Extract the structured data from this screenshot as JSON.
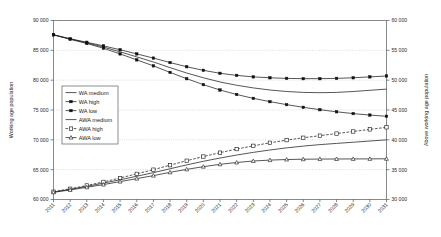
{
  "chart_data": {
    "type": "line",
    "title": "",
    "xlabel": "",
    "ylabel": "Working age population",
    "y2label": "Above working age population",
    "x": [
      2011,
      2012,
      2013,
      2014,
      2015,
      2016,
      2017,
      2018,
      2019,
      2020,
      2021,
      2022,
      2023,
      2024,
      2025,
      2026,
      2027,
      2028,
      2029,
      2030,
      2031
    ],
    "xtick_labels": [
      "2011",
      "2012",
      "2013",
      "2014",
      "2015",
      "2016",
      "2017",
      "2018",
      "2019",
      "2020",
      "2021",
      "2022",
      "2023",
      "2024",
      "2025",
      "2026",
      "2027",
      "2028",
      "2029",
      "2030",
      "2031"
    ],
    "ylim": [
      60000,
      90000
    ],
    "yticks": [
      60000,
      65000,
      70000,
      75000,
      80000,
      85000,
      90000
    ],
    "ytick_labels": [
      "60 000",
      "65 000",
      "70 000",
      "75 000",
      "80 000",
      "85 000",
      "90 000"
    ],
    "y2lim": [
      30000,
      60000
    ],
    "y2ticks": [
      30000,
      35000,
      40000,
      45000,
      50000,
      55000,
      60000
    ],
    "y2tick_labels": [
      "30 000",
      "35 000",
      "40 000",
      "45 000",
      "50 000",
      "55 000",
      "60 000"
    ],
    "grid": true,
    "legend_position": "left-middle",
    "series": [
      {
        "name": "WA medium",
        "axis": "left",
        "marker": "none",
        "line": "solid",
        "values": [
          87600,
          86900,
          86250,
          85550,
          84750,
          83900,
          83050,
          82100,
          81200,
          80400,
          79700,
          79150,
          78700,
          78350,
          78100,
          77950,
          77900,
          77950,
          78100,
          78300,
          78500
        ]
      },
      {
        "name": "WA high",
        "axis": "left",
        "marker": "filled-square",
        "line": "solid",
        "values": [
          87600,
          86950,
          86350,
          85750,
          85100,
          84400,
          83700,
          82950,
          82250,
          81650,
          81150,
          80800,
          80550,
          80400,
          80300,
          80250,
          80250,
          80300,
          80400,
          80550,
          80700
        ]
      },
      {
        "name": "WA low",
        "axis": "left",
        "marker": "filled-square",
        "line": "solid",
        "values": [
          87600,
          86850,
          86150,
          85350,
          84400,
          83400,
          82400,
          81300,
          80250,
          79250,
          78350,
          77600,
          76950,
          76400,
          75900,
          75450,
          75050,
          74700,
          74400,
          74150,
          73950
        ]
      },
      {
        "name": "AWA medium",
        "axis": "right",
        "marker": "none",
        "line": "solid",
        "values": [
          31250,
          31700,
          32200,
          32750,
          33300,
          33900,
          34500,
          35150,
          35800,
          36400,
          36950,
          37450,
          37900,
          38300,
          38650,
          38950,
          39200,
          39400,
          39600,
          39800,
          40000
        ]
      },
      {
        "name": "AWA high",
        "axis": "right",
        "marker": "open-square",
        "line": "dashed",
        "values": [
          31300,
          31800,
          32350,
          32950,
          33600,
          34300,
          35000,
          35750,
          36500,
          37200,
          37850,
          38450,
          39000,
          39500,
          39950,
          40350,
          40700,
          41050,
          41400,
          41750,
          42100
        ]
      },
      {
        "name": "AWA low",
        "axis": "right",
        "marker": "open-triangle",
        "line": "solid",
        "values": [
          31200,
          31600,
          32050,
          32500,
          33000,
          33500,
          34000,
          34550,
          35050,
          35500,
          35900,
          36200,
          36450,
          36600,
          36700,
          36750,
          36780,
          36790,
          36800,
          36810,
          36820
        ]
      }
    ]
  },
  "legend": {
    "items": [
      {
        "label": "WA medium"
      },
      {
        "label": "WA high"
      },
      {
        "label": "WA low"
      },
      {
        "label": "AWA medium"
      },
      {
        "label": "AWA high"
      },
      {
        "label": "AWA low"
      }
    ]
  }
}
